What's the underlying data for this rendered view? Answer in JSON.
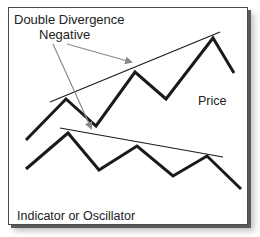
{
  "title": {
    "line1": "Double Divergence",
    "line2": "Negative"
  },
  "labels": {
    "price": "Price",
    "indicator": "Indicator or Oscillator"
  },
  "colors": {
    "line": "#1a1a1a",
    "arrow": "#8a8a8a",
    "frame": "#4a4a4a"
  },
  "diagram": {
    "price_line": [
      [
        26,
        140
      ],
      [
        66,
        99
      ],
      [
        96,
        126
      ],
      [
        135,
        72
      ],
      [
        166,
        99
      ],
      [
        213,
        38
      ],
      [
        234,
        73
      ]
    ],
    "price_trendline": [
      [
        50,
        102
      ],
      [
        220,
        32
      ]
    ],
    "indicator_line": [
      [
        26,
        169
      ],
      [
        68,
        133
      ],
      [
        99,
        170
      ],
      [
        137,
        146
      ],
      [
        173,
        176
      ],
      [
        207,
        156
      ],
      [
        241,
        189
      ]
    ],
    "indicator_trendline": [
      [
        60,
        128
      ],
      [
        223,
        157
      ]
    ],
    "arrows": [
      {
        "from": [
          53,
          44
        ],
        "to": [
          91,
          128
        ],
        "target": "indicator-divergence"
      },
      {
        "from": [
          67,
          44
        ],
        "to": [
          131,
          62
        ],
        "target": "price-divergence"
      }
    ]
  }
}
